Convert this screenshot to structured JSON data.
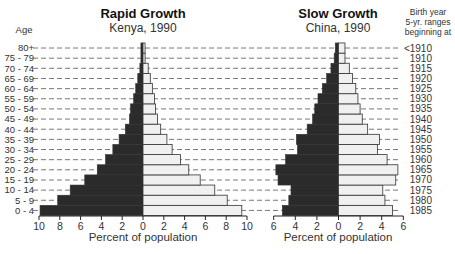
{
  "chart_data": [
    {
      "type": "bar",
      "subtype": "population-pyramid",
      "title": "Rapid Growth",
      "subtitle": "Kenya, 1990",
      "xlabel": "Percent of population",
      "ylabel": "Age",
      "categories": [
        "0 - 4",
        "5 - 9",
        "10 - 14",
        "15 - 19",
        "20 - 24",
        "25 - 29",
        "30 - 34",
        "35 - 39",
        "40 - 44",
        "45 - 49",
        "50 - 54",
        "55 - 59",
        "60 - 64",
        "65 - 69",
        "70 - 74",
        "75 - 79",
        "80+"
      ],
      "series": [
        {
          "name": "Male",
          "side": "left",
          "color": "#2b2b2b",
          "values": [
            9.9,
            8.2,
            7.0,
            5.6,
            4.4,
            3.6,
            2.9,
            2.3,
            1.7,
            1.3,
            1.2,
            0.9,
            0.7,
            0.5,
            0.3,
            0.2,
            0.2
          ]
        },
        {
          "name": "Female",
          "side": "right",
          "color": "#f0f0f0",
          "values": [
            9.5,
            8.1,
            6.9,
            5.5,
            4.4,
            3.6,
            2.8,
            2.3,
            1.7,
            1.4,
            1.2,
            1.1,
            0.9,
            0.7,
            0.5,
            0.2,
            0.2
          ]
        }
      ],
      "xlim": [
        -10,
        10
      ],
      "xticks": [
        "10",
        "8",
        "6",
        "4",
        "2",
        "0",
        "2",
        "4",
        "6",
        "8",
        "10"
      ],
      "grid": "dashed horizontal guide lines per age row"
    },
    {
      "type": "bar",
      "subtype": "population-pyramid",
      "title": "Slow Growth",
      "subtitle": "China, 1990",
      "xlabel": "Percent of population",
      "ylabel": "Birth year 5-yr. ranges beginning at",
      "categories": [
        "1985",
        "1980",
        "1975",
        "1970",
        "1965",
        "1960",
        "1955",
        "1950",
        "1945",
        "1940",
        "1935",
        "1930",
        "1925",
        "1920",
        "1915",
        "1910",
        "<1910"
      ],
      "series": [
        {
          "name": "Male",
          "side": "left",
          "color": "#2b2b2b",
          "values": [
            5.2,
            4.6,
            4.4,
            5.6,
            5.8,
            4.9,
            3.8,
            3.9,
            2.9,
            2.4,
            2.2,
            1.9,
            1.5,
            1.1,
            0.7,
            0.4,
            0.3
          ]
        },
        {
          "name": "Female",
          "side": "right",
          "color": "#f0f0f0",
          "values": [
            5.0,
            4.3,
            4.1,
            5.3,
            5.5,
            4.5,
            3.6,
            3.8,
            2.7,
            2.2,
            2.0,
            1.8,
            1.6,
            1.3,
            1.0,
            0.6,
            0.6
          ]
        }
      ],
      "xlim": [
        -6,
        6
      ],
      "xticks": [
        "6",
        "4",
        "2",
        "0",
        "2",
        "4",
        "6"
      ],
      "grid": "dashed horizontal guide lines per age row"
    }
  ],
  "labels": {
    "age_header": "Age",
    "birth_header": [
      "Birth year",
      "5-yr. ranges",
      "beginning at"
    ],
    "kenya_title": "Rapid Growth",
    "kenya_subtitle": "Kenya, 1990",
    "china_title": "Slow Growth",
    "china_subtitle": "China, 1990",
    "kenya_xlabel": "Percent of population",
    "china_xlabel": "Percent of population"
  },
  "colors": {
    "male_fill": "#2b2b2b",
    "female_fill": "#f0f0f0",
    "outline": "#333333",
    "dash": "#555555"
  }
}
